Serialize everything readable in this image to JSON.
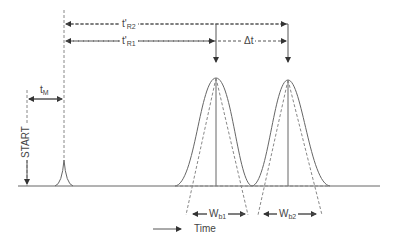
{
  "diagram": {
    "colors": {
      "line": "#666666",
      "text": "#444444",
      "background": "#ffffff"
    },
    "labels": {
      "t_R2": {
        "main": "t'",
        "sub": "R2"
      },
      "t_R1": {
        "main": "t'",
        "sub": "R1"
      },
      "delta_t": "Δt",
      "t_M": {
        "main": "t",
        "sub": "M"
      },
      "start": "START",
      "w_b1": {
        "main": "W",
        "sub": "b1"
      },
      "w_b2": {
        "main": "W",
        "sub": "b2"
      },
      "time_axis": "Time"
    },
    "elements": {
      "start_marker_x": 27,
      "dead_time_peak_x": 64,
      "peak1_x": 216,
      "peak2_x": 288,
      "baseline_y": 186
    }
  }
}
